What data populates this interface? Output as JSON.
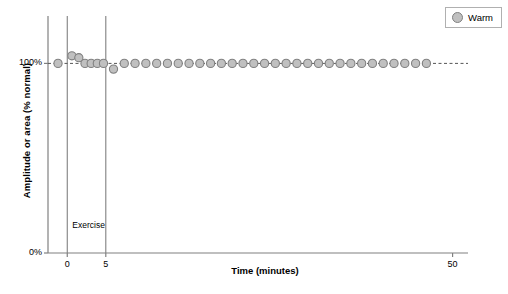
{
  "chart_data": {
    "type": "scatter",
    "title": "",
    "xlabel": "Time (minutes)",
    "ylabel": "Amplitude or area (% normal)",
    "xlim": [
      -2.5,
      52
    ],
    "ylim": [
      0,
      125
    ],
    "grid": false,
    "xticks": [
      0,
      5,
      50
    ],
    "xtick_labels": [
      "0",
      "5",
      "50"
    ],
    "yticks": [
      0,
      100
    ],
    "ytick_labels": [
      "0%",
      "100%"
    ],
    "reference_line_y": 100,
    "annotations": [
      {
        "text": "Exercise",
        "x": 5.3,
        "y": 14
      }
    ],
    "vertical_lines": [
      0,
      5
    ],
    "legend": {
      "position": "top-right",
      "entries": [
        {
          "name": "Warm",
          "marker": "circle",
          "fill": "#c0c0c0",
          "edge": "#808080"
        }
      ]
    },
    "series": [
      {
        "name": "Warm",
        "marker": "circle",
        "fill": "#c0c0c0",
        "edge": "#808080",
        "x": [
          -1.2,
          0.6,
          1.5,
          2.3,
          3.1,
          3.9,
          4.7,
          6.0,
          7.4,
          8.8,
          10.2,
          11.6,
          13.0,
          14.4,
          15.8,
          17.2,
          18.6,
          20.0,
          21.4,
          22.8,
          24.2,
          25.6,
          27.0,
          28.4,
          29.8,
          31.2,
          32.6,
          34.0,
          35.4,
          36.8,
          38.2,
          39.6,
          41.0,
          42.4,
          43.8,
          45.2,
          46.6
        ],
        "y": [
          100,
          104,
          103,
          100,
          100,
          100,
          100,
          97,
          100,
          100,
          100,
          100,
          100,
          100,
          100,
          100,
          100,
          100,
          100,
          100,
          100,
          100,
          100,
          100,
          100,
          100,
          100,
          100,
          100,
          100,
          100,
          100,
          100,
          100,
          100,
          100,
          100
        ]
      }
    ],
    "colors": {
      "axis": "#808080",
      "marker_fill": "#c0c0c0",
      "marker_edge": "#808080",
      "reference_line": "#555555",
      "text": "#000000"
    }
  }
}
